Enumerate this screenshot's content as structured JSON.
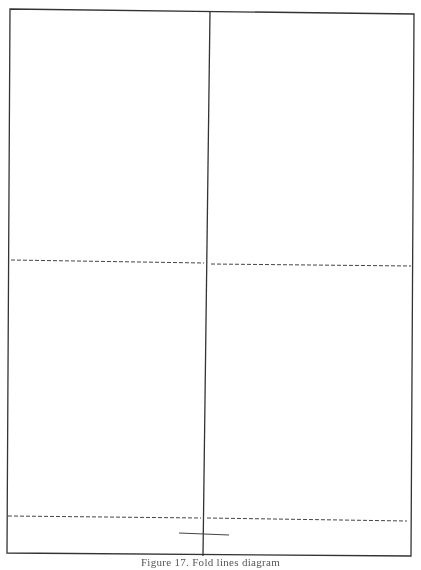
{
  "figure": {
    "caption": "Figure 17. Fold lines diagram",
    "stroke_color": "#333333",
    "dash_color": "#555555",
    "panels": [
      {
        "name": "top-left"
      },
      {
        "name": "top-right"
      },
      {
        "name": "bottom-left"
      },
      {
        "name": "bottom-right"
      }
    ],
    "lines": {
      "solid": "cut line",
      "dashed": "fold line"
    }
  }
}
